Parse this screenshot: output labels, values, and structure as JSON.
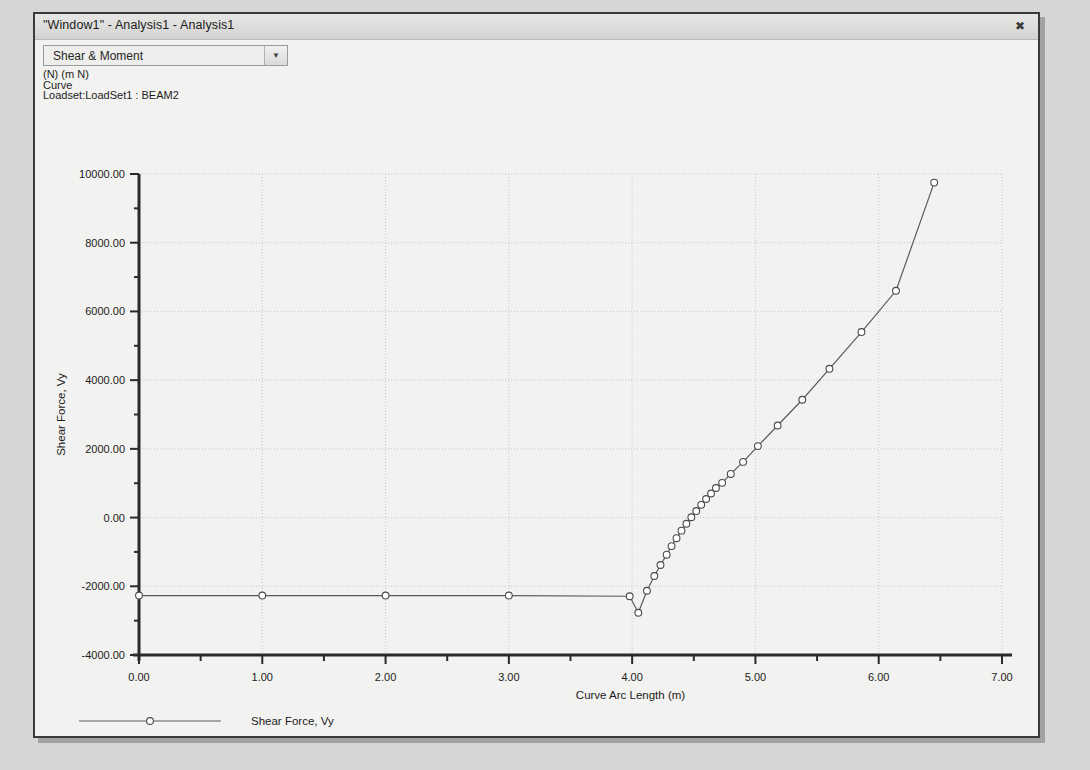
{
  "window": {
    "title": "\"Window1\" - Analysis1 - Analysis1",
    "close_label": "✖"
  },
  "toolbar": {
    "dropdown_value": "Shear & Moment",
    "dropdown_arrow": "▼",
    "dropdown_options": [
      "Shear & Moment"
    ]
  },
  "header_lines": {
    "units": "(N) (m N)",
    "kind": "Curve",
    "loadset": "Loadset:LoadSet1 : BEAM2"
  },
  "chart_data": {
    "type": "line",
    "title": "",
    "xlabel": "Curve Arc Length (m)",
    "ylabel": "Shear Force, Vy",
    "xlim": [
      0,
      7
    ],
    "ylim": [
      -4000,
      10000
    ],
    "xticks": [
      0,
      1,
      2,
      3,
      4,
      5,
      6,
      7
    ],
    "xtick_labels": [
      "0.00",
      "1.00",
      "2.00",
      "3.00",
      "4.00",
      "5.00",
      "6.00",
      "7.00"
    ],
    "yticks": [
      -4000,
      -2000,
      0,
      2000,
      4000,
      6000,
      8000,
      10000
    ],
    "ytick_labels": [
      "-4000.00",
      "-2000.00",
      "0.00",
      "2000.00",
      "4000.00",
      "6000.00",
      "8000.00",
      "10000.00"
    ],
    "minor_ticks": true,
    "grid": true,
    "grid_style": "dotted",
    "grid_color": "#c8c8c8",
    "line_color": "#5a5a5a",
    "marker": "circle-open",
    "marker_color": "#4a4a4a",
    "legend_position": "below-axes-left",
    "series": [
      {
        "name": "Shear Force, Vy",
        "x": [
          0.0,
          1.0,
          2.0,
          3.0,
          3.98,
          4.05,
          4.12,
          4.18,
          4.23,
          4.28,
          4.32,
          4.36,
          4.4,
          4.44,
          4.48,
          4.52,
          4.56,
          4.6,
          4.64,
          4.68,
          4.73,
          4.8,
          4.9,
          5.02,
          5.18,
          5.38,
          5.6,
          5.86,
          6.14,
          6.45
        ],
        "y": [
          -2270,
          -2270,
          -2270,
          -2270,
          -2290,
          -2770,
          -2130,
          -1700,
          -1380,
          -1080,
          -830,
          -600,
          -380,
          -180,
          10,
          190,
          370,
          540,
          700,
          860,
          1010,
          1270,
          1620,
          2080,
          2680,
          3430,
          4330,
          5400,
          6600,
          9750
        ]
      }
    ]
  },
  "legend": {
    "label": "Shear Force, Vy"
  }
}
